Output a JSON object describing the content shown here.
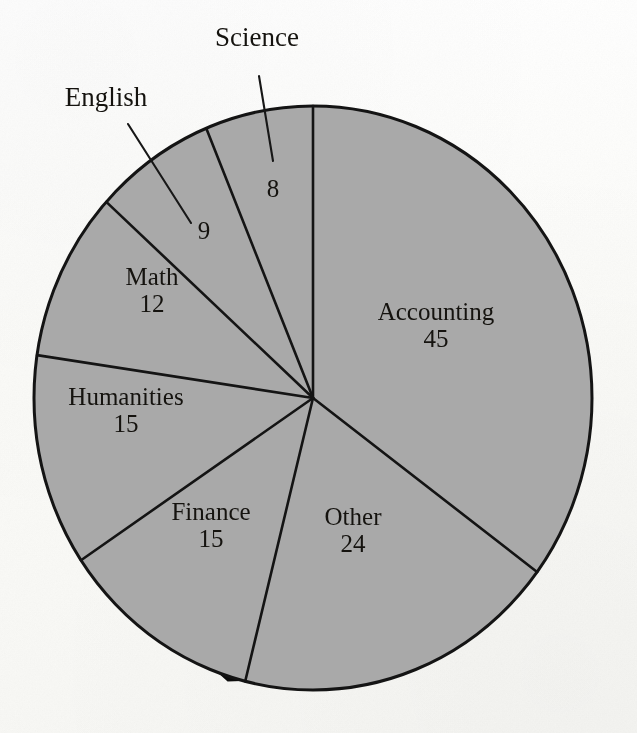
{
  "chart_data": {
    "type": "pie",
    "title": "",
    "subtitle": "",
    "xlabel": "",
    "ylabel": "",
    "legend_position": "none",
    "grid": false,
    "total": 128,
    "start_angle_deg": 0,
    "direction": "clockwise",
    "categories": [
      "Accounting",
      "Other",
      "Finance",
      "Humanities",
      "Math",
      "English",
      "Science"
    ],
    "values": [
      45,
      24,
      15,
      15,
      12,
      9,
      8
    ],
    "slices": [
      {
        "label": "Accounting",
        "value": 45,
        "value_text": "45",
        "angle_deg": 126.56,
        "label_mode": "inside",
        "label_x": 436,
        "label_y": 325,
        "name_visible": true
      },
      {
        "label": "Other",
        "value": 24,
        "value_text": "24",
        "angle_deg": 67.5,
        "label_mode": "inside",
        "label_x": 353,
        "label_y": 530,
        "name_visible": true
      },
      {
        "label": "Finance",
        "value": 15,
        "value_text": "15",
        "angle_deg": 42.19,
        "label_mode": "inside",
        "label_x": 211,
        "label_y": 525,
        "name_visible": true
      },
      {
        "label": "Humanities",
        "value": 15,
        "value_text": "15",
        "angle_deg": 42.19,
        "label_mode": "inside",
        "label_x": 126,
        "label_y": 410,
        "name_visible": true
      },
      {
        "label": "Math",
        "value": 12,
        "value_text": "12",
        "angle_deg": 33.75,
        "label_mode": "inside",
        "label_x": 152,
        "label_y": 290,
        "name_visible": true
      },
      {
        "label": "English",
        "value": 9,
        "value_text": "9",
        "angle_deg": 25.31,
        "label_mode": "leader",
        "label_x": 204,
        "label_y": 230,
        "name_visible": false
      },
      {
        "label": "Science",
        "value": 8,
        "value_text": "8",
        "angle_deg": 22.5,
        "label_mode": "leader",
        "label_x": 273,
        "label_y": 188,
        "name_visible": false
      }
    ],
    "outside_labels": [
      {
        "label": "English",
        "x": 106,
        "y": 98
      },
      {
        "label": "Science",
        "x": 257,
        "y": 38
      }
    ],
    "colors": {
      "slice_fill": "#a9a9a9",
      "outline": "#141414",
      "shadow_3d": "#0d0d0d",
      "background": "#fdfdfb",
      "text": "#15130f"
    }
  },
  "geometry": {
    "center_x": 313,
    "center_y": 398,
    "radius_x": 279,
    "radius_y": 292,
    "depth_offset_x": 10,
    "depth_offset_y": 9
  },
  "leaders": [
    {
      "name": "english-leader",
      "x1": 128,
      "y1": 124,
      "x2": 191,
      "y2": 223
    },
    {
      "name": "science-leader",
      "x1": 259,
      "y1": 76,
      "x2": 273,
      "y2": 161
    }
  ]
}
